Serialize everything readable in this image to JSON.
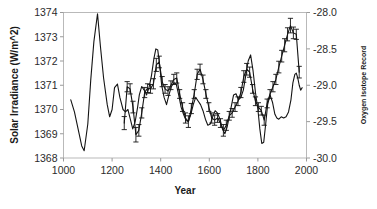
{
  "chart_data": {
    "type": "line",
    "title": "",
    "xlabel": "Year",
    "ylabel": "Solar Irradiance (W/m^2)",
    "y2label": "Oxygen Isotope Record",
    "xlim": [
      1000,
      2000
    ],
    "ylim": [
      1368,
      1374
    ],
    "y2lim": [
      -30.0,
      -28.0
    ],
    "grid": false,
    "legend": "none",
    "xticks": [
      "1000",
      "1200",
      "1400",
      "1600",
      "1800",
      "2000"
    ],
    "xtick_values": [
      1000,
      1200,
      1400,
      1600,
      1800,
      2000
    ],
    "yticks": [
      "1368",
      "1369",
      "1370",
      "1371",
      "1372",
      "1373",
      "1374"
    ],
    "ytick_values": [
      1368,
      1369,
      1370,
      1371,
      1372,
      1373,
      1374
    ],
    "y2ticks": [
      "-30.0",
      "-29.5",
      "-29.0",
      "-28.5",
      "-28.0"
    ],
    "y2tick_values": [
      -30.0,
      -29.5,
      -29.0,
      -28.5,
      -28.0
    ],
    "series": [
      {
        "name": "Solar Irradiance",
        "axis": "left",
        "style": "line",
        "marker": "none",
        "color": "#141414",
        "x": [
          1030,
          1045,
          1060,
          1075,
          1085,
          1100,
          1112,
          1125,
          1140,
          1152,
          1165,
          1180,
          1190,
          1200,
          1210,
          1222,
          1232,
          1245,
          1255,
          1265,
          1275,
          1285,
          1295,
          1305,
          1312,
          1322,
          1332,
          1342,
          1352,
          1362,
          1372,
          1380,
          1388,
          1396,
          1404,
          1414,
          1424,
          1434,
          1444,
          1454,
          1464,
          1474,
          1484,
          1494,
          1504,
          1514,
          1524,
          1534,
          1544,
          1554,
          1564,
          1574,
          1584,
          1594,
          1604,
          1614,
          1624,
          1634,
          1644,
          1654,
          1664,
          1674,
          1684,
          1694,
          1700,
          1710,
          1720,
          1730,
          1740,
          1750,
          1760,
          1770,
          1780,
          1790,
          1800,
          1808,
          1816,
          1824,
          1832,
          1840,
          1850,
          1860,
          1870,
          1878,
          1886,
          1896,
          1906,
          1916,
          1926,
          1936,
          1944,
          1952,
          1958,
          1964,
          1970,
          1976,
          1982
        ],
        "y": [
          1370.4,
          1369.9,
          1369.2,
          1368.5,
          1368.3,
          1369.4,
          1371.2,
          1372.8,
          1373.95,
          1372.6,
          1371.3,
          1370.2,
          1369.7,
          1370.0,
          1370.9,
          1371.05,
          1370.5,
          1370.0,
          1369.9,
          1370.0,
          1369.6,
          1369.2,
          1369.5,
          1370.1,
          1370.6,
          1370.95,
          1370.8,
          1370.6,
          1370.9,
          1371.4,
          1372.1,
          1372.5,
          1372.45,
          1371.8,
          1371.0,
          1370.5,
          1370.2,
          1370.6,
          1370.95,
          1371.1,
          1371.05,
          1370.6,
          1370.1,
          1369.8,
          1369.55,
          1369.5,
          1369.8,
          1370.2,
          1370.5,
          1370.35,
          1370.2,
          1369.95,
          1369.6,
          1369.35,
          1369.4,
          1369.7,
          1369.95,
          1369.85,
          1369.6,
          1369.2,
          1369.0,
          1369.3,
          1369.8,
          1370.3,
          1370.6,
          1370.65,
          1370.4,
          1370.5,
          1370.8,
          1371.4,
          1372.0,
          1372.25,
          1371.6,
          1370.7,
          1370.0,
          1369.2,
          1368.6,
          1368.65,
          1369.4,
          1370.2,
          1370.6,
          1370.3,
          1369.8,
          1369.65,
          1369.6,
          1369.7,
          1369.65,
          1369.7,
          1369.9,
          1370.4,
          1371.1,
          1371.45,
          1371.5,
          1371.3,
          1371.0,
          1370.8,
          1370.9
        ]
      },
      {
        "name": "Oxygen Isotope Record",
        "axis": "right",
        "style": "line-with-error-bars",
        "marker": "error-bar",
        "color": "#141414",
        "x": [
          1250,
          1262,
          1274,
          1286,
          1298,
          1310,
          1322,
          1334,
          1346,
          1358,
          1370,
          1382,
          1394,
          1406,
          1418,
          1430,
          1442,
          1454,
          1466,
          1478,
          1490,
          1502,
          1514,
          1526,
          1538,
          1550,
          1562,
          1574,
          1586,
          1598,
          1610,
          1622,
          1634,
          1646,
          1658,
          1670,
          1682,
          1694,
          1706,
          1718,
          1730,
          1742,
          1754,
          1766,
          1778,
          1790,
          1802,
          1814,
          1826,
          1838,
          1850,
          1862,
          1874,
          1886,
          1898,
          1910,
          1922,
          1934,
          1946,
          1958,
          1970
        ],
        "y": [
          -29.52,
          -29.02,
          -29.05,
          -29.3,
          -29.68,
          -29.62,
          -29.38,
          -29.1,
          -29.04,
          -29.05,
          -28.98,
          -28.72,
          -28.68,
          -28.95,
          -29.05,
          -29.08,
          -29.0,
          -28.92,
          -28.9,
          -29.12,
          -29.3,
          -29.45,
          -29.5,
          -29.32,
          -29.12,
          -28.85,
          -28.78,
          -28.92,
          -29.12,
          -29.3,
          -29.45,
          -29.48,
          -29.45,
          -29.52,
          -29.62,
          -29.55,
          -29.42,
          -29.38,
          -29.3,
          -29.22,
          -29.1,
          -28.88,
          -28.78,
          -28.82,
          -29.05,
          -29.22,
          -29.3,
          -29.35,
          -29.48,
          -29.25,
          -29.12,
          -29.02,
          -28.92,
          -28.75,
          -28.6,
          -28.45,
          -28.3,
          -28.18,
          -28.28,
          -28.3,
          -28.82
        ],
        "error": [
          0.09,
          0.07,
          0.07,
          0.08,
          0.1,
          0.08,
          0.07,
          0.07,
          0.06,
          0.06,
          0.07,
          0.09,
          0.08,
          0.07,
          0.06,
          0.06,
          0.06,
          0.07,
          0.07,
          0.06,
          0.06,
          0.07,
          0.08,
          0.07,
          0.06,
          0.07,
          0.07,
          0.06,
          0.06,
          0.06,
          0.07,
          0.07,
          0.06,
          0.06,
          0.08,
          0.07,
          0.06,
          0.06,
          0.06,
          0.06,
          0.07,
          0.08,
          0.08,
          0.07,
          0.06,
          0.06,
          0.06,
          0.06,
          0.07,
          0.06,
          0.06,
          0.07,
          0.07,
          0.08,
          0.08,
          0.09,
          0.09,
          0.1,
          0.08,
          0.07,
          0.08
        ]
      }
    ]
  }
}
